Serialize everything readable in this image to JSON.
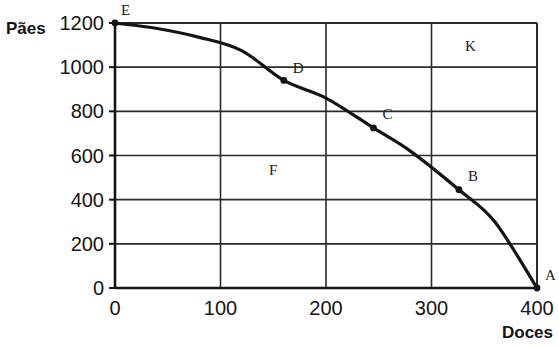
{
  "chart_data": {
    "type": "line",
    "title": "",
    "subtitle": "",
    "xlabel": "Doces",
    "ylabel": "Pães",
    "xlim": [
      0,
      400
    ],
    "ylim": [
      0,
      1200
    ],
    "xticks": [
      "0",
      "100",
      "200",
      "300",
      "400"
    ],
    "xtick_values": [
      0,
      100,
      200,
      300,
      400
    ],
    "yticks": [
      "0",
      "200",
      "400",
      "600",
      "800",
      "1000",
      "1200"
    ],
    "ytick_values": [
      0,
      200,
      400,
      600,
      800,
      1000,
      1200
    ],
    "grid": true,
    "legend": "none",
    "series": [
      {
        "name": "Curva de possibilidades de produção",
        "x": [
          0,
          40,
          80,
          120,
          160,
          200,
          245,
          280,
          326,
          360,
          400
        ],
        "y": [
          1200,
          1175,
          1135,
          1075,
          940,
          860,
          725,
          620,
          445,
          300,
          0
        ]
      }
    ],
    "points": [
      {
        "label": "A",
        "x": 400,
        "y": 0,
        "label_dx": 8,
        "label_dy": -8
      },
      {
        "label": "B",
        "x": 326,
        "y": 445,
        "label_dx": 9,
        "label_dy": -9
      },
      {
        "label": "C",
        "x": 245,
        "y": 725,
        "label_dx": 9,
        "label_dy": -9
      },
      {
        "label": "D",
        "x": 160,
        "y": 940,
        "label_dx": 9,
        "label_dy": -7
      },
      {
        "label": "E",
        "x": 0,
        "y": 1200,
        "label_dx": 6,
        "label_dy": -8
      }
    ],
    "annotations": [
      {
        "label": "F",
        "x": 150,
        "y": 510
      },
      {
        "label": "K",
        "x": 337,
        "y": 1075
      }
    ],
    "colors": {
      "curve": "#141414",
      "grid": "#2b2b2b",
      "axis": "#141414",
      "text": "#151515",
      "background": "#ffffff"
    }
  }
}
